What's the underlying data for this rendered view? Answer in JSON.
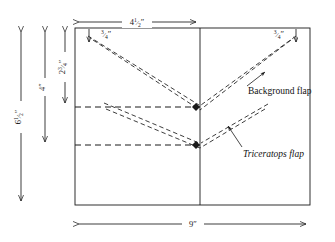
{
  "diagram": {
    "paper_color": "#ffffff",
    "line_color": "#1a1a1a",
    "dimensions": {
      "overall_width": "9\"",
      "overall_height": "6½\"",
      "left_panel_width": "4½\"",
      "mid_height": "4\"",
      "upper_fold_height": "2¾\"",
      "top_left_offset": "¾\"",
      "top_right_offset": "¾\""
    },
    "labels": {
      "width_9": "9\"",
      "height_6_half": "6½\"",
      "width_4_half": "4½\"",
      "height_4": "4\"",
      "height_2_three_quarter": "2¾\"",
      "offset_left_3_4": "¾\"",
      "offset_right_3_4": "¾\"",
      "background_flap": "Background flap",
      "triceratops_flap": "Triceratops flap"
    },
    "geometry": {
      "rect_left": 75,
      "rect_right": 310,
      "rect_top": 28,
      "rect_bottom": 205,
      "center_x": 200,
      "upper_vertex_y": 107,
      "lower_vertex_y": 145
    }
  }
}
